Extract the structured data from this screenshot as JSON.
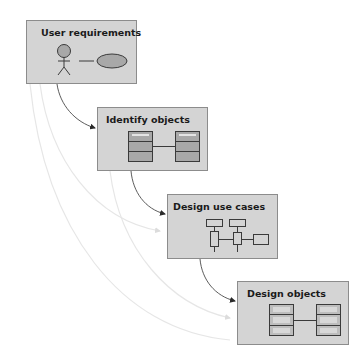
{
  "diagram": {
    "type": "process-flow",
    "colors": {
      "box_fill": "#d4d4d4",
      "box_border": "#8c8c8c",
      "icon_fill": "#a8a8a8",
      "arrow_dark": "#4a4a4a",
      "arrow_faint": "#e6e6e6"
    },
    "steps": [
      {
        "id": "step1",
        "title": "User requirements",
        "icon": "actor-and-use-case-icon"
      },
      {
        "id": "step2",
        "title": "Identify objects",
        "icon": "two-linked-classes-icon"
      },
      {
        "id": "step3",
        "title": "Design use cases",
        "icon": "sequence-blocks-icon"
      },
      {
        "id": "step4",
        "title": "Design objects",
        "icon": "two-linked-detailed-classes-icon"
      }
    ],
    "connections": [
      {
        "from": "step1",
        "to": "step2",
        "style": "dark"
      },
      {
        "from": "step2",
        "to": "step3",
        "style": "dark"
      },
      {
        "from": "step3",
        "to": "step4",
        "style": "dark"
      },
      {
        "from": "step1",
        "to": "step3",
        "style": "faint"
      },
      {
        "from": "step2",
        "to": "step4",
        "style": "faint"
      },
      {
        "from": "step1",
        "to": "step4",
        "style": "faint"
      }
    ]
  }
}
